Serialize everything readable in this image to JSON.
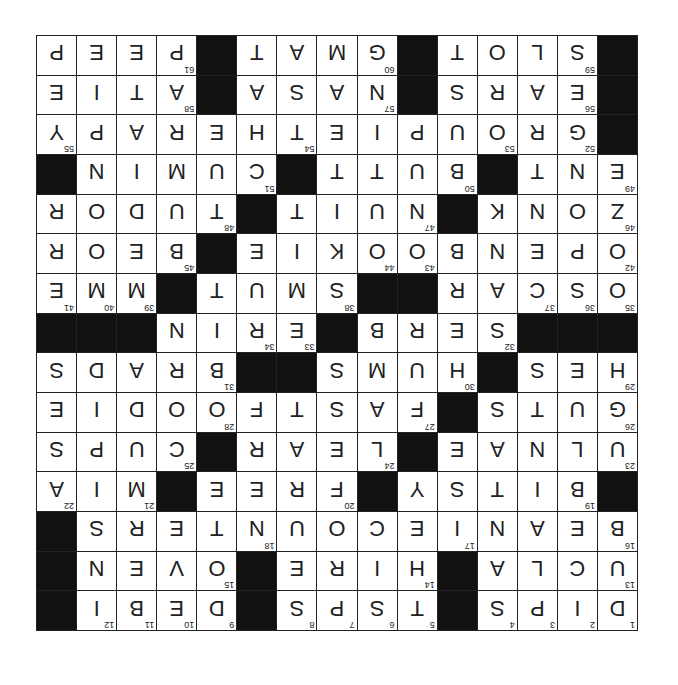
{
  "puzzle": {
    "size": 15,
    "orientation_degrees": 180,
    "colors": {
      "block": "#111111",
      "cell": "#ffffff",
      "ink": "#222222"
    },
    "rows": [
      [
        "D",
        "I",
        "P",
        "S",
        "#",
        "T",
        "S",
        "P",
        "S",
        "#",
        "D",
        "E",
        "B",
        "I",
        "#"
      ],
      [
        "U",
        "C",
        "L",
        "A",
        "#",
        "H",
        "I",
        "R",
        "E",
        "#",
        "O",
        "V",
        "E",
        "N",
        "#"
      ],
      [
        "B",
        "E",
        "A",
        "N",
        "I",
        "E",
        "C",
        "O",
        "U",
        "N",
        "T",
        "E",
        "R",
        "S",
        "#"
      ],
      [
        "#",
        "B",
        "I",
        "T",
        "S",
        "Y",
        "#",
        "F",
        "R",
        "E",
        "E",
        "#",
        "M",
        "I",
        "A"
      ],
      [
        "U",
        "L",
        "N",
        "A",
        "E",
        "#",
        "L",
        "E",
        "A",
        "R",
        "#",
        "C",
        "U",
        "P",
        "S"
      ],
      [
        "G",
        "U",
        "T",
        "S",
        "#",
        "F",
        "A",
        "S",
        "T",
        "F",
        "O",
        "O",
        "D",
        "I",
        "E"
      ],
      [
        "H",
        "E",
        "S",
        "#",
        "H",
        "U",
        "M",
        "S",
        "#",
        "#",
        "B",
        "R",
        "A",
        "D",
        "S"
      ],
      [
        "#",
        "#",
        "#",
        "S",
        "E",
        "R",
        "B",
        "#",
        "E",
        "R",
        "I",
        "N",
        "#",
        "#",
        "#"
      ],
      [
        "O",
        "S",
        "C",
        "A",
        "R",
        "#",
        "#",
        "S",
        "M",
        "U",
        "T",
        "#",
        "M",
        "M",
        "E"
      ],
      [
        "O",
        "P",
        "E",
        "N",
        "B",
        "O",
        "O",
        "K",
        "I",
        "E",
        "#",
        "B",
        "E",
        "O",
        "R"
      ],
      [
        "Z",
        "O",
        "N",
        "K",
        "#",
        "N",
        "U",
        "I",
        "T",
        "#",
        "T",
        "U",
        "D",
        "O",
        "R"
      ],
      [
        "E",
        "N",
        "T",
        "#",
        "B",
        "U",
        "T",
        "T",
        "#",
        "C",
        "U",
        "M",
        "I",
        "N",
        "#"
      ],
      [
        "#",
        "G",
        "R",
        "O",
        "U",
        "P",
        "I",
        "E",
        "T",
        "H",
        "E",
        "R",
        "A",
        "P",
        "Y"
      ],
      [
        "#",
        "E",
        "A",
        "R",
        "S",
        "#",
        "N",
        "A",
        "S",
        "A",
        "#",
        "A",
        "T",
        "I",
        "E"
      ],
      [
        "#",
        "S",
        "L",
        "O",
        "T",
        "#",
        "G",
        "M",
        "A",
        "T",
        "#",
        "P",
        "E",
        "E",
        "P"
      ]
    ],
    "numbers": [
      [
        1,
        2,
        3,
        4,
        0,
        5,
        6,
        7,
        8,
        0,
        9,
        10,
        11,
        12,
        0
      ],
      [
        13,
        0,
        0,
        0,
        0,
        14,
        0,
        0,
        0,
        0,
        15,
        0,
        0,
        0,
        0
      ],
      [
        16,
        0,
        0,
        0,
        17,
        0,
        0,
        0,
        0,
        18,
        0,
        0,
        0,
        0,
        0
      ],
      [
        0,
        19,
        0,
        0,
        0,
        0,
        0,
        20,
        0,
        0,
        0,
        0,
        21,
        0,
        22
      ],
      [
        23,
        0,
        0,
        0,
        0,
        0,
        24,
        0,
        0,
        0,
        0,
        25,
        0,
        0,
        0
      ],
      [
        26,
        0,
        0,
        0,
        0,
        27,
        0,
        0,
        0,
        0,
        28,
        0,
        0,
        0,
        0
      ],
      [
        29,
        0,
        0,
        0,
        30,
        0,
        0,
        0,
        0,
        0,
        31,
        0,
        0,
        0,
        0
      ],
      [
        0,
        0,
        0,
        32,
        0,
        0,
        0,
        0,
        33,
        34,
        0,
        0,
        0,
        0,
        0
      ],
      [
        35,
        36,
        37,
        0,
        0,
        0,
        0,
        38,
        0,
        0,
        0,
        0,
        39,
        40,
        41
      ],
      [
        42,
        0,
        0,
        0,
        0,
        43,
        44,
        0,
        0,
        0,
        0,
        45,
        0,
        0,
        0
      ],
      [
        46,
        0,
        0,
        0,
        0,
        47,
        0,
        0,
        0,
        0,
        48,
        0,
        0,
        0,
        0
      ],
      [
        49,
        0,
        0,
        0,
        50,
        0,
        0,
        0,
        0,
        51,
        0,
        0,
        0,
        0,
        0
      ],
      [
        0,
        52,
        0,
        53,
        0,
        0,
        0,
        0,
        54,
        0,
        0,
        0,
        0,
        0,
        55
      ],
      [
        0,
        56,
        0,
        0,
        0,
        0,
        57,
        0,
        0,
        0,
        0,
        58,
        0,
        0,
        0
      ],
      [
        0,
        59,
        0,
        0,
        0,
        0,
        60,
        0,
        0,
        0,
        0,
        61,
        0,
        0,
        0
      ]
    ]
  }
}
